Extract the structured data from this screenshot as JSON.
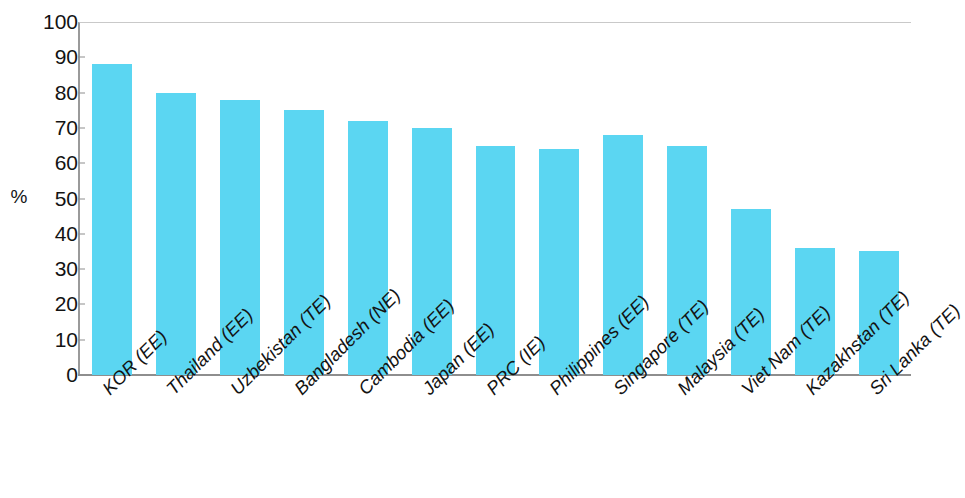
{
  "chart_data": {
    "type": "bar",
    "title": "",
    "subtitle": "",
    "xlabel": "",
    "ylabel": "%",
    "ylim": [
      0,
      100
    ],
    "ytick_step": 10,
    "ytick_labels": [
      "100",
      "90",
      "80",
      "70",
      "60",
      "50",
      "40",
      "30",
      "20",
      "10",
      "0"
    ],
    "grid": false,
    "legend": null,
    "bar_color": "#5BD6F2",
    "categories": [
      "KOR (EE)",
      "Thailand (EE)",
      "Uzbekistan (TE)",
      "Bangladesh (NE)",
      "Cambodia (EE)",
      "Japan (EE)",
      "PRC (IE)",
      "Philippines (EE)",
      "Singapore (TE)",
      "Malaysia (TE)",
      "Viet Nam (TE)",
      "Kazakhstan (TE)",
      "Sri Lanka (TE)"
    ],
    "values": [
      88,
      80,
      78,
      75,
      72,
      70,
      65,
      64,
      68,
      65,
      47,
      36,
      35
    ]
  }
}
